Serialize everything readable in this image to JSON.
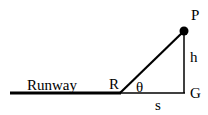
{
  "diagram": {
    "labels": {
      "runway": "Runway",
      "point_R": "R",
      "point_P": "P",
      "point_G": "G",
      "height": "h",
      "distance": "s",
      "angle": "θ"
    },
    "colors": {
      "line": "#000000",
      "background": "#ffffff"
    }
  }
}
